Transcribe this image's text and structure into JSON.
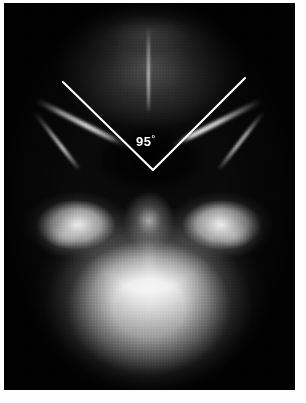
{
  "image": {
    "kind": "radiograph",
    "view": "submentovertex-skull",
    "alt": "Submentovertex skull radiograph with angle measurement overlay",
    "paper_color": "#ffffff",
    "film_color": "#0a0a0a"
  },
  "annotation": {
    "type": "angle-measurement",
    "value": "95",
    "unit_symbol": "°",
    "label": "95°",
    "label_value": "95",
    "color": "#ffffff",
    "vertex": {
      "x": 149,
      "y": 167
    },
    "rays": [
      {
        "name": "left-ray",
        "x1": 59,
        "y1": 79,
        "x2": 149,
        "y2": 167
      },
      {
        "name": "right-ray",
        "x1": 241,
        "y1": 75,
        "x2": 149,
        "y2": 167
      }
    ],
    "label_position": {
      "x": 132,
      "y": 130
    }
  },
  "anatomy": {
    "regions": [
      {
        "name": "calvarium",
        "label": "occipital calvarium"
      },
      {
        "name": "petrous-mastoid",
        "label": "petrous / mastoid"
      },
      {
        "name": "skull-base",
        "label": "skull base"
      },
      {
        "name": "maxilla-palate",
        "label": "maxilla / palate"
      },
      {
        "name": "zygomatic-arch-left",
        "label": "left zygomatic arch"
      },
      {
        "name": "zygomatic-arch-right",
        "label": "right zygomatic arch"
      },
      {
        "name": "mandibular-ramus-left",
        "label": "left mandibular ramus"
      },
      {
        "name": "mandibular-ramus-right",
        "label": "right mandibular ramus"
      },
      {
        "name": "nasal-septum",
        "label": "nasal septum / vomer"
      },
      {
        "name": "nasopharyngeal-airway",
        "label": "nasopharyngeal airway"
      }
    ]
  }
}
